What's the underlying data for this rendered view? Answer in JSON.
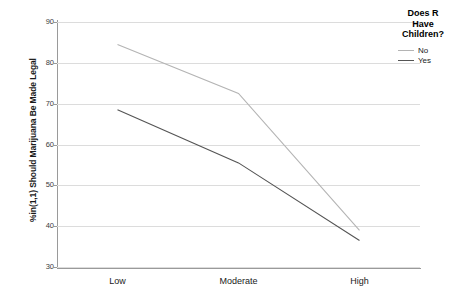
{
  "chart_data": {
    "type": "line",
    "title": "",
    "xlabel": "",
    "ylabel": "%in(1,1) Should Marijuana Be Made Legal",
    "categories": [
      "Low",
      "Moderate",
      "High"
    ],
    "series": [
      {
        "name": "No",
        "values": [
          84.5,
          72.5,
          39.0
        ],
        "color": "#b4b4b4"
      },
      {
        "name": "Yes",
        "values": [
          68.5,
          55.5,
          36.5
        ],
        "color": "#545454"
      }
    ],
    "ylim": [
      30,
      90
    ],
    "yticks": [
      30,
      40,
      50,
      60,
      70,
      80,
      90
    ],
    "ytick_labels": [
      "30",
      "40",
      "50",
      "60",
      "70",
      "80",
      "90"
    ],
    "grid": true,
    "legend_position": "top-right",
    "legend_title": "Does R Have Children?"
  },
  "legend": {
    "title_line1": "Does R",
    "title_line2": "Have",
    "title_line3": "Children?",
    "entries": [
      {
        "label": "No"
      },
      {
        "label": "Yes"
      }
    ]
  },
  "axes": {
    "y_title": "%in(1,1) Should Marijuana Be Made Legal"
  }
}
